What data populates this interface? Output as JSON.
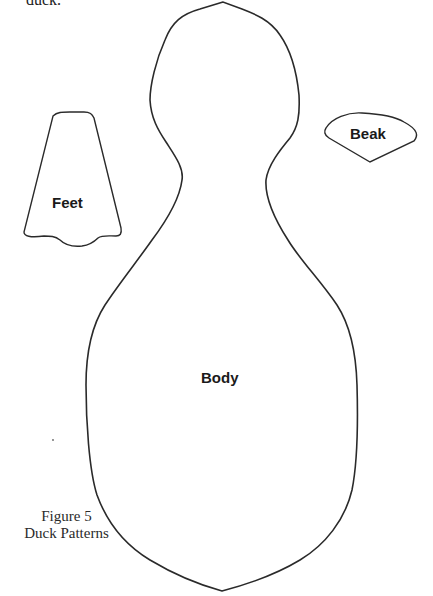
{
  "document": {
    "top_text_fragment": "duck.",
    "figure": {
      "number_label": "Figure 5",
      "title": "Duck Patterns"
    },
    "pattern_pieces": [
      {
        "name": "body",
        "label": "Body"
      },
      {
        "name": "feet",
        "label": "Feet"
      },
      {
        "name": "beak",
        "label": "Beak"
      }
    ],
    "colors": {
      "outline": "#2a2a2a",
      "background": "#ffffff"
    }
  }
}
